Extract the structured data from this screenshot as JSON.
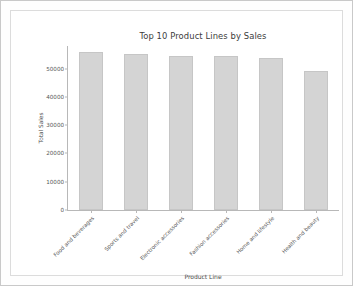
{
  "chart_data": {
    "type": "bar",
    "title": "Top 10 Product Lines by Sales",
    "xlabel": "Product Line",
    "ylabel": "Total Sales",
    "categories": [
      "Food and beverages",
      "Sports and travel",
      "Electronic accessories",
      "Fashion accessories",
      "Home and lifestyle",
      "Health and beauty"
    ],
    "values": [
      56000,
      55100,
      54400,
      54400,
      53900,
      49200
    ],
    "ylim": [
      0,
      58000
    ],
    "yticks": [
      0,
      10000,
      20000,
      30000,
      40000,
      50000
    ],
    "ytick_labels": [
      "0",
      "10000",
      "20000",
      "30000",
      "40000",
      "50000"
    ],
    "grid": false,
    "legend": null,
    "bar_color": "#d4d4d4",
    "bar_edge_color": "#c6c6c6"
  }
}
